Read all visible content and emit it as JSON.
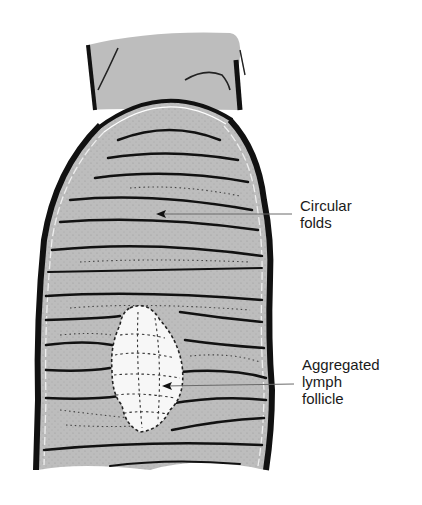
{
  "figure": {
    "colors": {
      "mucosa_fill": "#bdbdbd",
      "outline": "#111111",
      "follicle_fill": "#f7f7f7",
      "leader_line": "#6a6a6a",
      "background": "#ffffff"
    }
  },
  "labels": [
    {
      "id": "circular-folds",
      "lines": [
        "Circular",
        "folds"
      ]
    },
    {
      "id": "aggregated-lymph-follicle",
      "lines": [
        "Aggregated",
        "lymph",
        "follicle"
      ]
    }
  ]
}
